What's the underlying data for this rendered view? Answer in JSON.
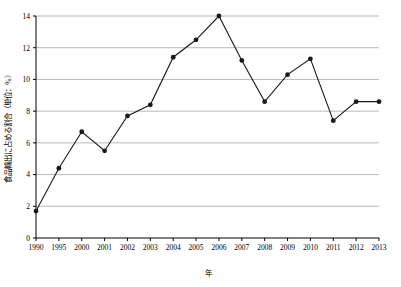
{
  "chart_data": {
    "type": "line",
    "title": "",
    "xlabel": "年",
    "ylabel": "食品輸出に占める割合（単位：%）",
    "xlim": [
      1990,
      2013
    ],
    "ylim": [
      0,
      14
    ],
    "yticks": [
      0,
      2,
      4,
      6,
      8,
      10,
      12,
      14
    ],
    "xticks": [
      1990,
      1995,
      2000,
      2001,
      2002,
      2003,
      2004,
      2005,
      2006,
      2007,
      2008,
      2009,
      2010,
      2011,
      2012,
      2013
    ],
    "grid": true,
    "legend": "none",
    "series": [
      {
        "name": "食品輸出に占める割合",
        "x": [
          1990,
          1995,
          2000,
          2001,
          2002,
          2003,
          2004,
          2005,
          2006,
          2007,
          2008,
          2009,
          2010,
          2011,
          2012,
          2013
        ],
        "values": [
          1.7,
          4.4,
          6.7,
          5.5,
          7.7,
          8.4,
          11.4,
          12.5,
          14.0,
          11.2,
          8.6,
          10.3,
          11.3,
          7.4,
          8.6,
          8.6
        ]
      }
    ]
  }
}
